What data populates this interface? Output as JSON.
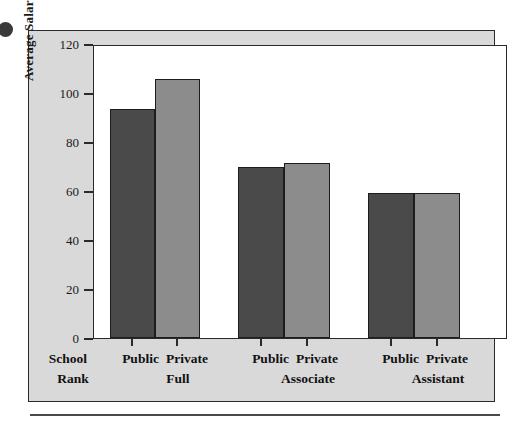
{
  "figure": {
    "background_color": "#d9d9d9",
    "plot_background_color": "#ffffff",
    "border_color": "#2a2a2a"
  },
  "chart_data": {
    "type": "bar",
    "title": "",
    "xlabel": "School Rank",
    "ylabel": "Average Salary ($ Thousands)",
    "ylim": [
      0,
      125
    ],
    "yticks": [
      0,
      20,
      40,
      60,
      80,
      100,
      120
    ],
    "ytick_labels": [
      "0",
      "20",
      "40",
      "60",
      "80",
      "100",
      "120"
    ],
    "grid": false,
    "legend": "none",
    "categories": [
      "Full",
      "Associate",
      "Assistant"
    ],
    "series": [
      {
        "name": "Public",
        "color": "#4a4a4a",
        "values": [
          98,
          73,
          62
        ]
      },
      {
        "name": "Private",
        "color": "#8c8c8c",
        "values": [
          111,
          75,
          62
        ]
      }
    ],
    "bars": [
      {
        "group": "Full",
        "school": "Public",
        "value": 98
      },
      {
        "group": "Full",
        "school": "Private",
        "value": 111
      },
      {
        "group": "Associate",
        "school": "Public",
        "value": 73
      },
      {
        "group": "Associate",
        "school": "Private",
        "value": 75
      },
      {
        "group": "Assistant",
        "school": "Public",
        "value": 62
      },
      {
        "group": "Assistant",
        "school": "Private",
        "value": 62
      }
    ]
  },
  "axis": {
    "y_label": "Average Salary ($ Thousands)",
    "tick_0": "0",
    "tick_20": "20",
    "tick_40": "40",
    "tick_60": "60",
    "tick_80": "80",
    "tick_100": "100",
    "tick_120": "120"
  },
  "xaxis": {
    "rank_header_line1": "School",
    "rank_header_line2": "Rank",
    "groups": [
      {
        "public": "Public",
        "private": "Private",
        "name": "Full"
      },
      {
        "public": "Public",
        "private": "Private",
        "name": "Associate"
      },
      {
        "public": "Public",
        "private": "Private",
        "name": "Assistant"
      }
    ]
  }
}
